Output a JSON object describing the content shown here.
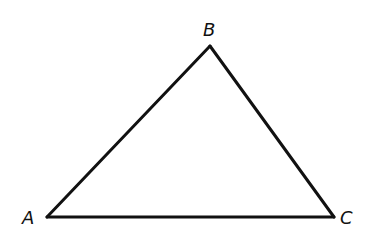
{
  "diagram": {
    "type": "triangle",
    "stroke_color": "#111111",
    "background_color": "#ffffff",
    "vertices": [
      {
        "name": "A",
        "label": "A",
        "x": 47,
        "y": 217
      },
      {
        "name": "B",
        "label": "B",
        "x": 210,
        "y": 46
      },
      {
        "name": "C",
        "label": "C",
        "x": 334,
        "y": 217
      }
    ],
    "edges": [
      {
        "from": "A",
        "to": "B"
      },
      {
        "from": "B",
        "to": "C"
      },
      {
        "from": "C",
        "to": "A"
      }
    ]
  }
}
